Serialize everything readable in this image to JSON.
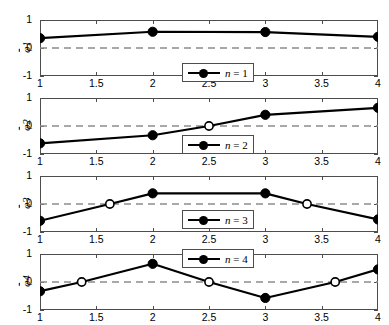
{
  "figure": {
    "panel_count": 4,
    "background": "#ffffff",
    "axis_color": "#4d4d4d",
    "line_color": "#000000",
    "zero_line_color": "#8c8c8c"
  },
  "axes": {
    "xlim": [
      1,
      4
    ],
    "ylim": [
      -1,
      1
    ],
    "xticks": [
      "1",
      "1.5",
      "2",
      "2.5",
      "3",
      "3.5",
      "4"
    ],
    "xtick_values": [
      1,
      1.5,
      2,
      2.5,
      3,
      3.5,
      4
    ],
    "yticks": [
      "1",
      "0",
      "-1"
    ],
    "ytick_values": [
      1,
      0,
      -1
    ],
    "grid": false,
    "zero_line": true,
    "zero_line_style": "dashed"
  },
  "chart_data": {
    "type": "line",
    "title": "",
    "xlabel": "",
    "ylabel": "phi-bar_n",
    "xlim": [
      1,
      4
    ],
    "ylim": [
      -1,
      1
    ],
    "xticks": [
      1,
      1.5,
      2,
      2.5,
      3,
      3.5,
      4
    ],
    "yticks": [
      -1,
      0,
      1
    ],
    "grid": false,
    "legend_position": "inside",
    "panels": [
      {
        "index": 1,
        "ylabel": "φ̄1",
        "ylabel_base": "φ",
        "ylabel_sub": "1",
        "legend": "n = 1",
        "legend_symbol": "n",
        "legend_value": "1",
        "x": [
          1,
          2,
          3,
          4
        ],
        "y": [
          0.35,
          0.58,
          0.57,
          0.4
        ],
        "filled_markers": [
          {
            "x": 1,
            "y": 0.35
          },
          {
            "x": 2,
            "y": 0.58
          },
          {
            "x": 3,
            "y": 0.57
          },
          {
            "x": 4,
            "y": 0.4
          }
        ],
        "open_markers": []
      },
      {
        "index": 2,
        "ylabel": "φ̄2",
        "ylabel_base": "φ",
        "ylabel_sub": "2",
        "legend": "n = 2",
        "legend_symbol": "n",
        "legend_value": "2",
        "x": [
          1,
          2,
          2.5,
          3,
          4
        ],
        "y": [
          -0.62,
          -0.33,
          0.0,
          0.4,
          0.65
        ],
        "filled_markers": [
          {
            "x": 1,
            "y": -0.62
          },
          {
            "x": 2,
            "y": -0.33
          },
          {
            "x": 3,
            "y": 0.4
          },
          {
            "x": 4,
            "y": 0.65
          }
        ],
        "open_markers": [
          {
            "x": 2.5,
            "y": 0.0
          }
        ]
      },
      {
        "index": 3,
        "ylabel": "φ̄3",
        "ylabel_base": "φ",
        "ylabel_sub": "3",
        "legend": "n = 3",
        "legend_symbol": "n",
        "legend_value": "3",
        "x": [
          1,
          1.62,
          2,
          3,
          3.37,
          4
        ],
        "y": [
          -0.6,
          0.0,
          0.38,
          0.38,
          0.0,
          -0.55
        ],
        "filled_markers": [
          {
            "x": 1,
            "y": -0.6
          },
          {
            "x": 2,
            "y": 0.38
          },
          {
            "x": 3,
            "y": 0.38
          },
          {
            "x": 4,
            "y": -0.55
          }
        ],
        "open_markers": [
          {
            "x": 1.62,
            "y": 0.0
          },
          {
            "x": 3.37,
            "y": 0.0
          }
        ]
      },
      {
        "index": 4,
        "ylabel": "φ̄4",
        "ylabel_base": "φ",
        "ylabel_sub": "4",
        "legend": "n = 4",
        "legend_symbol": "n",
        "legend_value": "4",
        "x": [
          1,
          1.37,
          2,
          2.5,
          3,
          3.62,
          4
        ],
        "y": [
          -0.33,
          0.0,
          0.65,
          0.0,
          -0.57,
          0.0,
          0.45
        ],
        "filled_markers": [
          {
            "x": 1,
            "y": -0.33
          },
          {
            "x": 2,
            "y": 0.65
          },
          {
            "x": 3,
            "y": -0.57
          },
          {
            "x": 4,
            "y": 0.45
          }
        ],
        "open_markers": [
          {
            "x": 1.37,
            "y": 0.0
          },
          {
            "x": 2.5,
            "y": 0.0
          },
          {
            "x": 3.62,
            "y": 0.0
          }
        ]
      }
    ]
  }
}
